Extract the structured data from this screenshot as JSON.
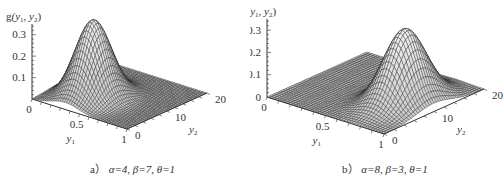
{
  "chart_data": [
    {
      "type": "surface3d",
      "title": "a) α=4, β=7, θ=1",
      "caption_prefix": "a）",
      "params": {
        "alpha": 4,
        "beta": 7,
        "theta": 1
      },
      "zlabel": "g(y1, y2)",
      "xlabel": "y1",
      "ylabel": "y2",
      "xlim": [
        0,
        1
      ],
      "ylim": [
        0,
        20
      ],
      "zlim": [
        0,
        0.35
      ],
      "x_ticks": [
        "0",
        "0.5",
        "1"
      ],
      "y_ticks": [
        "0",
        "10",
        "20"
      ],
      "z_ticks": [
        "0.1",
        "0.2",
        "0.3"
      ],
      "peak": {
        "y1": 0.35,
        "y2": 7,
        "value": 0.36
      },
      "grid": false,
      "surface_style": "black wireframe mesh on light grey"
    },
    {
      "type": "surface3d",
      "title": "b) α=8, β=3, θ=1",
      "caption_prefix": "b）",
      "params": {
        "alpha": 8,
        "beta": 3,
        "theta": 1
      },
      "zlabel": "g(y1, y2)",
      "xlabel": "y1",
      "ylabel": "y2",
      "xlim": [
        0,
        1
      ],
      "ylim": [
        0,
        20
      ],
      "zlim": [
        0,
        0.35
      ],
      "x_ticks": [
        "0",
        "0.5",
        "1"
      ],
      "y_ticks": [
        "0",
        "10",
        "20"
      ],
      "z_ticks": [
        "0",
        "0.1",
        "0.2",
        "0.3"
      ],
      "peak": {
        "y1": 0.75,
        "y2": 10,
        "value": 0.33
      },
      "grid": false,
      "surface_style": "black wireframe mesh on light grey"
    }
  ],
  "captions": {
    "a": {
      "label": "a）",
      "alpha": "α=4,",
      "beta": "β=7,",
      "theta": "θ=1"
    },
    "b": {
      "label": "b）",
      "alpha": "α=8,",
      "beta": "β=3,",
      "theta": "θ=1"
    }
  },
  "axis_labels": {
    "z_prefix": "g",
    "z_args": "(y1, y2)",
    "x": "y",
    "x_sub": "1",
    "y": "y",
    "y_sub": "2"
  }
}
